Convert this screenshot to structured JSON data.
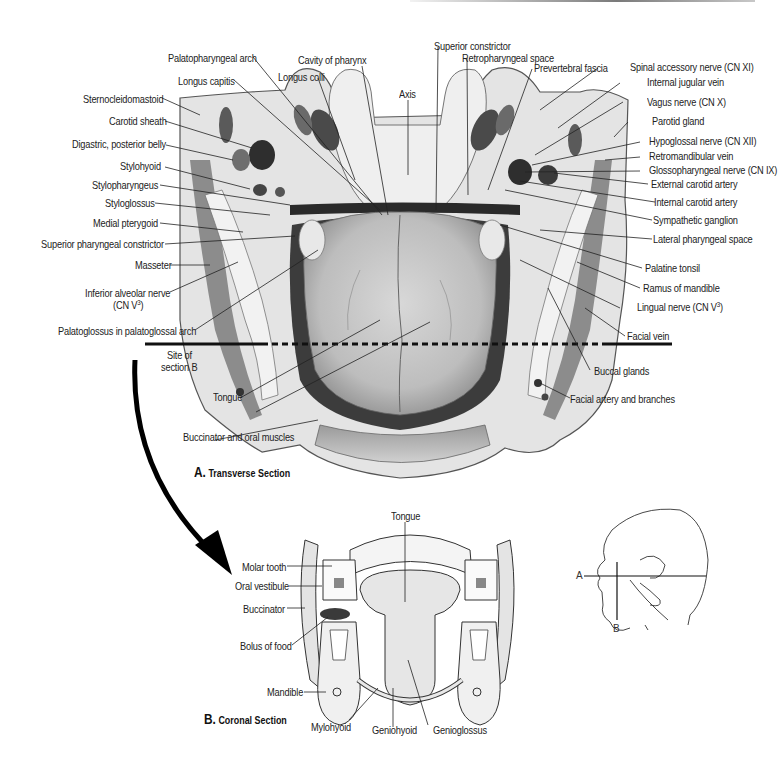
{
  "figure": {
    "section_a": {
      "letter": "A.",
      "title": "Transverse Section",
      "labels_left": [
        {
          "id": "palatopharyngeal-arch",
          "text": "Palatopharyngeal arch"
        },
        {
          "id": "longus-capitis",
          "text": "Longus capitis"
        },
        {
          "id": "longus-colli",
          "text": "Longus colli"
        },
        {
          "id": "cavity-of-pharynx",
          "text": "Cavity of pharynx"
        },
        {
          "id": "sternocleidomastoid",
          "text": "Sternocleidomastoid"
        },
        {
          "id": "carotid-sheath",
          "text": "Carotid sheath"
        },
        {
          "id": "digastric-posterior-belly",
          "text": "Digastric, posterior belly"
        },
        {
          "id": "stylohyoid",
          "text": "Stylohyoid"
        },
        {
          "id": "stylopharyngeus",
          "text": "Stylopharyngeus"
        },
        {
          "id": "styloglossus",
          "text": "Styloglossus"
        },
        {
          "id": "medial-pterygoid",
          "text": "Medial pterygoid"
        },
        {
          "id": "superior-pharyngeal-constrictor",
          "text": "Superior pharyngeal constrictor"
        },
        {
          "id": "masseter",
          "text": "Masseter"
        },
        {
          "id": "inferior-alveolar-nerve",
          "text": "Inferior alveolar nerve",
          "sub": "(CN V",
          "sup": "3",
          "tail": ")"
        },
        {
          "id": "palatoglossus",
          "text": "Palatoglossus in palatoglossal arch"
        },
        {
          "id": "site-of-section-b",
          "text": "Site of",
          "text2": "section B"
        },
        {
          "id": "tongue",
          "text": "Tongue"
        },
        {
          "id": "buccinator-oral-muscles",
          "text": "Buccinator and oral muscles"
        }
      ],
      "labels_center": [
        {
          "id": "axis",
          "text": "Axis"
        },
        {
          "id": "superior-constrictor",
          "text": "Superior constrictor"
        },
        {
          "id": "retropharyngeal-space",
          "text": "Retropharyngeal space"
        },
        {
          "id": "prevertebral-fascia",
          "text": "Prevertebral fascia"
        }
      ],
      "labels_right": [
        {
          "id": "spinal-accessory-nerve",
          "text": "Spinal accessory nerve (CN XI)"
        },
        {
          "id": "internal-jugular-vein",
          "text": "Internal jugular vein"
        },
        {
          "id": "vagus-nerve",
          "text": "Vagus nerve (CN X)"
        },
        {
          "id": "parotid-gland",
          "text": "Parotid gland"
        },
        {
          "id": "hypoglossal-nerve",
          "text": "Hypoglossal nerve (CN XII)"
        },
        {
          "id": "retromandibular-vein",
          "text": "Retromandibular vein"
        },
        {
          "id": "glossopharyngeal-nerve",
          "text": "Glossopharyngeal nerve (CN IX)"
        },
        {
          "id": "external-carotid-artery",
          "text": "External carotid artery"
        },
        {
          "id": "internal-carotid-artery",
          "text": "Internal carotid artery"
        },
        {
          "id": "sympathetic-ganglion",
          "text": "Sympathetic ganglion"
        },
        {
          "id": "lateral-pharyngeal-space",
          "text": "Lateral pharyngeal space"
        },
        {
          "id": "palatine-tonsil",
          "text": "Palatine tonsil"
        },
        {
          "id": "ramus-of-mandible",
          "text": "Ramus of mandible"
        },
        {
          "id": "lingual-nerve",
          "text": "Lingual nerve (CN V",
          "sup": "3",
          "tail": ")"
        },
        {
          "id": "facial-vein",
          "text": "Facial vein"
        },
        {
          "id": "buccal-glands",
          "text": "Buccal glands"
        },
        {
          "id": "facial-artery",
          "text": "Facial artery and branches"
        }
      ]
    },
    "section_b": {
      "letter": "B.",
      "title": "Coronal Section",
      "labels": [
        {
          "id": "tongue-b",
          "text": "Tongue"
        },
        {
          "id": "molar-tooth",
          "text": "Molar tooth"
        },
        {
          "id": "oral-vestibule",
          "text": "Oral vestibule"
        },
        {
          "id": "buccinator",
          "text": "Buccinator"
        },
        {
          "id": "bolus-of-food",
          "text": "Bolus of food"
        },
        {
          "id": "mandible",
          "text": "Mandible"
        },
        {
          "id": "mylohyoid",
          "text": "Mylohyoid"
        },
        {
          "id": "geniohyoid",
          "text": "Geniohyoid"
        },
        {
          "id": "genioglossus",
          "text": "Genioglossus"
        }
      ]
    },
    "orientation": {
      "plane_a": "A",
      "plane_b": "B"
    }
  }
}
